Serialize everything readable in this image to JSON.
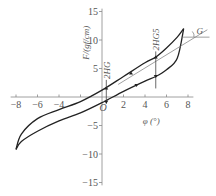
{
  "chart_data": {
    "type": "line",
    "title": "",
    "xlabel": "φ (°)",
    "ylabel": "F/(gf/cm)",
    "xlim": [
      -8.5,
      8.5
    ],
    "ylim": [
      -16,
      16
    ],
    "x_ticks": [
      -8,
      -6,
      -4,
      -2,
      0,
      2,
      4,
      6,
      8
    ],
    "x_tick_labels": [
      "−8",
      "−6",
      "−4",
      "",
      "0",
      "2",
      "4",
      "6",
      "8"
    ],
    "y_ticks": [
      -15,
      -10,
      -5,
      5,
      10,
      15
    ],
    "y_tick_labels": [
      "−15",
      "−10",
      "−5",
      "5",
      "10",
      "15"
    ],
    "grid": false,
    "legend": null,
    "series": [
      {
        "name": "upper branch (hysteresis loop)",
        "x": [
          -8,
          -7.5,
          -6,
          -4,
          -2,
          0,
          2,
          4,
          5,
          6,
          7,
          7.6
        ],
        "y": [
          -9.2,
          -6.5,
          -3.8,
          -2.2,
          -0.8,
          1.2,
          3.6,
          6.0,
          7.0,
          8.6,
          10.5,
          12.0
        ]
      },
      {
        "name": "lower branch (hysteresis loop)",
        "x": [
          -8,
          -7.5,
          -6,
          -4,
          -2,
          0,
          2,
          4,
          5,
          6,
          7,
          7.6
        ],
        "y": [
          -9.2,
          -7.8,
          -6.0,
          -4.2,
          -2.8,
          -1.0,
          1.0,
          2.8,
          3.6,
          4.8,
          6.8,
          12.0
        ]
      }
    ],
    "annotations": [
      {
        "text": "2HG",
        "x": 0.4,
        "y_range": [
          -1.2,
          3.0
        ],
        "style": "vertical marker with arrows"
      },
      {
        "text": "2HG5",
        "x": 5.0,
        "y_range": [
          1.5,
          8.0
        ],
        "style": "vertical marker with arrows"
      },
      {
        "text": "G",
        "description": "slope angle of line through loop tip relative to horizontal"
      }
    ]
  }
}
